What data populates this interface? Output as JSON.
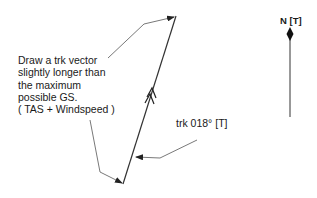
{
  "note": {
    "lines": [
      "Draw a trk vector",
      "slightly longer than",
      "the maximum",
      "possible GS.",
      "( TAS + Windspeed )"
    ]
  },
  "track_label": "trk 018° [T]",
  "north_label": "N [T]",
  "colors": {
    "line": "#333333",
    "text": "#1a1a1a",
    "background": "#ffffff"
  }
}
